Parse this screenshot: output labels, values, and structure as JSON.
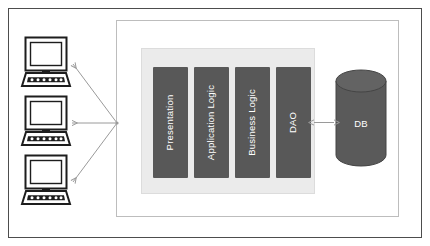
{
  "diagram": {
    "page_border_color": "#4a4a4a",
    "background_color": "#ffffff",
    "server_container": {
      "name": "server-container",
      "border_color": "#b9b9b9",
      "fill_color": "#ffffff"
    },
    "application_panel": {
      "name": "application-panel",
      "fill_color": "#ebebeb",
      "border_color": "#d8d8d8"
    },
    "layers": [
      {
        "label": "Presentation",
        "fill": "#585858"
      },
      {
        "label": "Application Logic",
        "fill": "#585858"
      },
      {
        "label": "Business Logic",
        "fill": "#585858"
      },
      {
        "label": "DAO",
        "fill": "#585858"
      }
    ],
    "database": {
      "label": "DB",
      "fill": "#5a5a5a",
      "top_fill": "#636363",
      "stroke": "#3f3f3f"
    },
    "clients": [
      {
        "label": "client-terminal-1"
      },
      {
        "label": "client-terminal-2"
      },
      {
        "label": "client-terminal-3"
      }
    ],
    "connectors": [
      {
        "name": "client-link-top",
        "style": "arrow-left",
        "color": "#9a9a9a"
      },
      {
        "name": "client-link-middle",
        "style": "arrow-left",
        "color": "#9a9a9a"
      },
      {
        "name": "client-link-bottom",
        "style": "arrow-left",
        "color": "#9a9a9a"
      },
      {
        "name": "dao-db-link",
        "style": "double-arrow",
        "color": "#9a9a9a"
      }
    ]
  }
}
